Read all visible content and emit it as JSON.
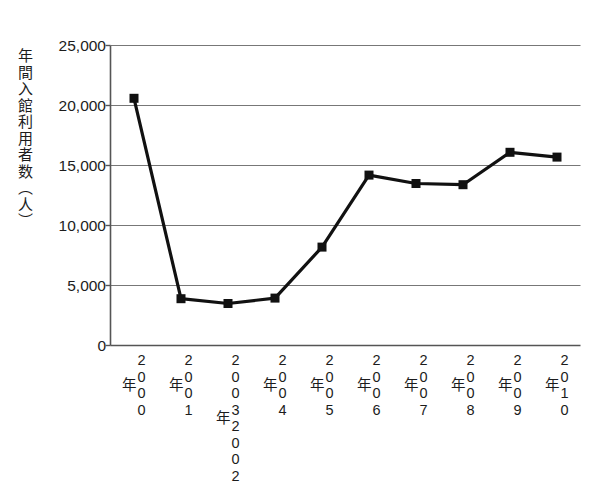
{
  "chart_data": {
    "type": "line",
    "title": "",
    "xlabel": "",
    "ylabel": "年間入館利用者数（人）",
    "ylim": [
      0,
      25000
    ],
    "ytick_values": [
      0,
      5000,
      10000,
      15000,
      20000,
      25000
    ],
    "ytick_labels": [
      "0",
      "5,000",
      "10,000",
      "15,000",
      "20,000",
      "25,000"
    ],
    "grid": true,
    "legend": "none",
    "categories": [
      "2000年",
      "2001年",
      "2002年2003年",
      "2004年",
      "2005年",
      "2006年",
      "2007年",
      "2008年",
      "2009年",
      "2010年"
    ],
    "category_labels": [
      {
        "line1": "2000",
        "line2": "",
        "suffix": "年"
      },
      {
        "line1": "2001",
        "line2": "",
        "suffix": "年"
      },
      {
        "line1": "2002",
        "line2": "2003",
        "suffix": "年"
      },
      {
        "line1": "2004",
        "line2": "",
        "suffix": "年"
      },
      {
        "line1": "2005",
        "line2": "",
        "suffix": "年"
      },
      {
        "line1": "2006",
        "line2": "",
        "suffix": "年"
      },
      {
        "line1": "2007",
        "line2": "",
        "suffix": "年"
      },
      {
        "line1": "2008",
        "line2": "",
        "suffix": "年"
      },
      {
        "line1": "2009",
        "line2": "",
        "suffix": "年"
      },
      {
        "line1": "2010",
        "line2": "",
        "suffix": "年"
      }
    ],
    "values": [
      20600,
      3900,
      3500,
      3950,
      8200,
      14200,
      13500,
      13400,
      16100,
      15700
    ],
    "series": [
      {
        "name": "年間入館利用者数",
        "values": [
          20600,
          3900,
          3500,
          3950,
          8200,
          14200,
          13500,
          13400,
          16100,
          15700
        ]
      }
    ],
    "line_color": "#111111",
    "marker": "square",
    "marker_color": "#111111",
    "axis_color": "#555555",
    "grid_color": "#777777",
    "background": "#ffffff"
  }
}
